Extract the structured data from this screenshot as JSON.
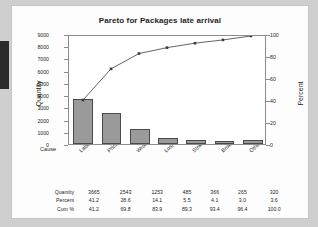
{
  "chart_title": "Pareto for Packages late arrival",
  "axes": {
    "y_left_title": "Quantity",
    "y_right_title": "Percent",
    "x_axis_label": "Cause",
    "y_left_ticks": [
      "0",
      "1000",
      "2000",
      "3000",
      "4000",
      "5000",
      "6000",
      "7000",
      "8000",
      "9000"
    ],
    "y_right_ticks": [
      "0",
      "20",
      "40",
      "60",
      "80",
      "100"
    ]
  },
  "table": {
    "row_labels": [
      "Quantity",
      "Percent",
      "Cum %"
    ],
    "quantity": [
      "3665",
      "2543",
      "1253",
      "485",
      "366",
      "265",
      "320"
    ],
    "percent": [
      "41.2",
      "28.6",
      "14.1",
      "5.5",
      "4.1",
      "3.0",
      "3.6"
    ],
    "cum_percent": [
      "41.2",
      "69.8",
      "83.9",
      "89.3",
      "93.4",
      "96.4",
      "100.0"
    ]
  },
  "colors": {
    "bar_fill": "#9a9a9a",
    "bar_border": "#4a4a4a",
    "line": "#3a3a3a",
    "frame": "#8c8c8c",
    "page_background": "#cfcfcf",
    "card_background": "#fdfdfd"
  },
  "chart_data": {
    "type": "bar",
    "title": "Pareto for Packages late arrival",
    "xlabel": "Cause",
    "ylabel": "Quantity",
    "y2label": "Percent",
    "categories": [
      "Label readability",
      "Pricing",
      "Wrong label",
      "Lost",
      "Strike",
      "Broken",
      "Other"
    ],
    "values": [
      3665,
      2543,
      1253,
      485,
      366,
      265,
      320
    ],
    "percent": [
      41.2,
      28.6,
      14.1,
      5.5,
      4.1,
      3.0,
      3.6
    ],
    "cum_percent": [
      41.2,
      69.8,
      83.9,
      89.3,
      93.4,
      96.4,
      100.0
    ],
    "ylim": [
      0,
      9000
    ],
    "y2lim": [
      0,
      100
    ],
    "yticks": [
      0,
      1000,
      2000,
      3000,
      4000,
      5000,
      6000,
      7000,
      8000,
      9000
    ],
    "y2ticks": [
      0,
      20,
      40,
      60,
      80,
      100
    ],
    "grid": false,
    "legend": "none",
    "series": [
      {
        "name": "Quantity",
        "type": "bar",
        "values": [
          3665,
          2543,
          1253,
          485,
          366,
          265,
          320
        ]
      },
      {
        "name": "Cum %",
        "type": "line",
        "values": [
          41.2,
          69.8,
          83.9,
          89.3,
          93.4,
          96.4,
          100.0
        ]
      }
    ]
  }
}
